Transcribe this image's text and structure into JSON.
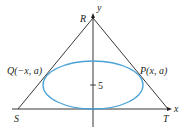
{
  "figure": {
    "colors": {
      "line": "#231f20",
      "ellipse": "#4aa3d6",
      "background": "#ffffff"
    },
    "axes": {
      "x_label": "x",
      "y_label": "y",
      "y_tick_label": "5"
    },
    "vertices": {
      "apex": "R",
      "bottom_left": "S",
      "bottom_right": "T"
    },
    "points": {
      "left": "Q(−x, a)",
      "right": "P(x, a)"
    }
  }
}
